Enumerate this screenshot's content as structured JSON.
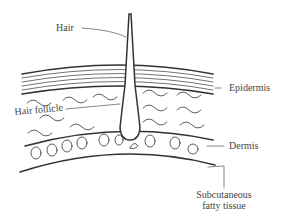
{
  "diagram": {
    "labels": {
      "hair": "Hair",
      "epidermis": "Epidermis",
      "hair_follicle": "Hair follicle",
      "dermis": "Dermis",
      "subcutaneous_line1": "Subcutaneous",
      "subcutaneous_line2": "fatty tissue"
    },
    "colors": {
      "stroke": "#333333",
      "leader": "#555555",
      "text": "#444444"
    }
  }
}
